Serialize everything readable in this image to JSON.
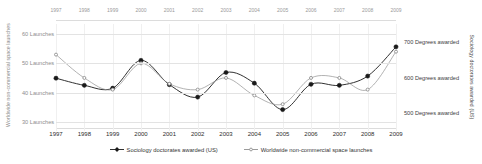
{
  "chart_data": {
    "type": "line",
    "title": "",
    "subtitle": "",
    "categories": [
      "1997",
      "1998",
      "1999",
      "2000",
      "2001",
      "2002",
      "2003",
      "2004",
      "2005",
      "2006",
      "2007",
      "2008",
      "2009"
    ],
    "x": [
      1997,
      1998,
      1999,
      2000,
      2001,
      2002,
      2003,
      2004,
      2005,
      2006,
      2007,
      2008,
      2009
    ],
    "grid": true,
    "legend_position": "bottom",
    "axes": {
      "x_top": {
        "labels": [
          "1997",
          "1998",
          "1999",
          "2000",
          "2001",
          "2002",
          "2003",
          "2004",
          "2005",
          "2006",
          "2007",
          "2008",
          "2009"
        ]
      },
      "x_bottom": {
        "labels": [
          "1997",
          "1998",
          "1999",
          "2000",
          "2001",
          "2002",
          "2003",
          "2004",
          "2005",
          "2006",
          "2007",
          "2008",
          "2009"
        ]
      },
      "y_left": {
        "title": "Worldwide non-commercial space launches",
        "ticks": [
          60,
          50,
          40,
          30
        ],
        "tick_labels": [
          "60 Launches",
          "50 Launches",
          "40 Launches",
          "30 Launches"
        ],
        "range": [
          26.8,
          63.5
        ]
      },
      "y_right": {
        "title": "Sociology doctorates awarded (US)",
        "ticks": [
          700,
          600,
          500
        ],
        "tick_labels": [
          "700 Degrees awarded",
          "600 Degrees awarded",
          "500 Degrees awarded"
        ],
        "range": [
          450,
          750
        ]
      }
    },
    "series": [
      {
        "name": "Sociology doctorates awarded (US)",
        "axis": "right",
        "unit": "Degrees awarded",
        "color": "#1a1a1a",
        "marker": "filled-diamond",
        "values": [
          598,
          578,
          570,
          648,
          580,
          545,
          614,
          584,
          510,
          581,
          578,
          604,
          686
        ]
      },
      {
        "name": "Worldwide non-commercial space launches",
        "axis": "left",
        "unit": "Launches",
        "color": "#909090",
        "marker": "open-dot",
        "values": [
          53,
          45,
          41,
          50,
          43,
          41,
          45,
          39,
          36,
          45,
          45,
          41,
          54
        ]
      }
    ]
  },
  "legend": {
    "items": [
      {
        "label": "Sociology doctorates awarded (US)",
        "marker": "filled-diamond-marker",
        "color": "#1a1a1a"
      },
      {
        "label": "Worldwide non-commercial space launches",
        "marker": "open-dot-marker",
        "color": "#909090"
      }
    ]
  }
}
